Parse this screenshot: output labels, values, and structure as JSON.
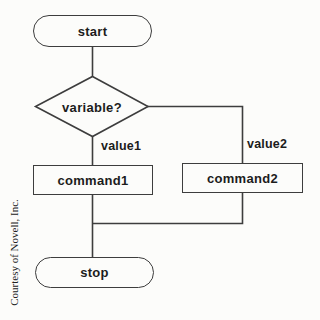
{
  "diagram": {
    "type": "flowchart",
    "nodes": {
      "start": {
        "label": "start",
        "shape": "terminator"
      },
      "decision": {
        "label": "variable?",
        "shape": "diamond"
      },
      "command1": {
        "label": "command1",
        "shape": "process"
      },
      "command2": {
        "label": "command2",
        "shape": "process"
      },
      "stop": {
        "label": "stop",
        "shape": "terminator"
      }
    },
    "branches": {
      "value1": {
        "label": "value1",
        "from": "decision",
        "to": "command1"
      },
      "value2": {
        "label": "value2",
        "from": "decision",
        "to": "command2"
      }
    },
    "credit": "Courtesy of Novell, Inc.",
    "colors": {
      "line": "#3d3d3d",
      "text": "#1c1c1c",
      "background": "#fcfcfa"
    }
  }
}
